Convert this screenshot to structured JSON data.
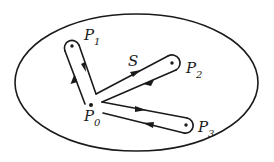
{
  "diagram": {
    "type": "topological loop diagram",
    "region": {
      "shape": "ellipse",
      "cx": 136.5,
      "cy": 82.5,
      "rx": 121.5,
      "ry": 68.5
    },
    "base_point": {
      "label": "P",
      "subscript": "0",
      "x": 91,
      "y": 105
    },
    "points": [
      {
        "id": "P1",
        "label": "P",
        "subscript": "1",
        "x": 72,
        "y": 46
      },
      {
        "id": "P2",
        "label": "P",
        "subscript": "2",
        "x": 172,
        "y": 63
      },
      {
        "id": "P3",
        "label": "P",
        "subscript": "3",
        "x": 186,
        "y": 125
      }
    ],
    "loop_label": "S",
    "colors": {
      "ink": "#1a1a1a",
      "background": "#ffffff"
    }
  }
}
